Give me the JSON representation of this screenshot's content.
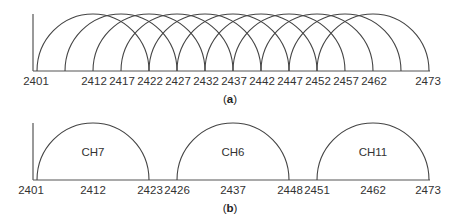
{
  "panel_a": {
    "caption_open": "(",
    "caption_letter": "a",
    "caption_close": ")",
    "arc_starts_mhz": [
      2401,
      2406,
      2411,
      2416,
      2421,
      2426,
      2431,
      2436,
      2441,
      2446,
      2451
    ],
    "arc_width_mhz": 22,
    "tick_labels": [
      "2401",
      "2412",
      "2417",
      "2422",
      "2427",
      "2432",
      "2437",
      "2442",
      "2447",
      "2452",
      "2457",
      "2462",
      "2473"
    ]
  },
  "panel_b": {
    "caption_open": "(",
    "caption_letter": "b",
    "caption_close": ")",
    "channels": [
      {
        "label": "CH7",
        "start": "2401",
        "center": "2412",
        "end": "2423"
      },
      {
        "label": "CH6",
        "start": "2426",
        "center": "2437",
        "end": "2448"
      },
      {
        "label": "CH11",
        "start": "2451",
        "center": "2462",
        "end": "2473"
      }
    ]
  }
}
